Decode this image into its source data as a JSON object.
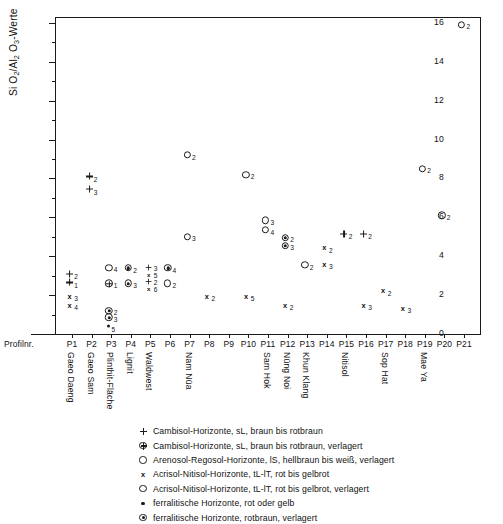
{
  "chart_data": {
    "type": "scatter",
    "title": "",
    "ylabel": "Si O2/Al2 O3-Werte",
    "xlabel": "Profilnr.",
    "ylim": [
      0,
      16.3
    ],
    "yticks": [
      0,
      2,
      4,
      6,
      8,
      10,
      12,
      14,
      16
    ],
    "grid": false,
    "legend_position": "below",
    "x_axis_prefix": "Profilnr.",
    "categories": [
      "P1",
      "P2",
      "P3",
      "P4",
      "P5",
      "P6",
      "P7",
      "P8",
      "P9",
      "P10",
      "P11",
      "P12",
      "P13",
      "P14",
      "P15",
      "P16",
      "P17",
      "P18",
      "P19",
      "P20",
      "P21"
    ],
    "site_names": [
      {
        "profile": "P1",
        "name": "Gaeo Daeng"
      },
      {
        "profile": "P2",
        "name": "Gaeo Sam"
      },
      {
        "profile": "P3",
        "name": "Plinthit-Fläche"
      },
      {
        "profile": "P4",
        "name": "Lignit"
      },
      {
        "profile": "P5",
        "name": "Waldwest"
      },
      {
        "profile": "P7",
        "name": "Nam Nüa"
      },
      {
        "profile": "P11",
        "name": "Sam Hok"
      },
      {
        "profile": "P12",
        "name": "Nüng Noi"
      },
      {
        "profile": "P13",
        "name": "Khun Klang"
      },
      {
        "profile": "P15",
        "name": "Nitisol"
      },
      {
        "profile": "P17",
        "name": "Sop Hat"
      },
      {
        "profile": "P19",
        "name": "Mae Ya"
      }
    ],
    "symbols": {
      "plus": "+",
      "plus_circle": "⊕",
      "circle": "○",
      "x": "x",
      "circle2": "○",
      "dot": "·",
      "ferralitic": "◉"
    },
    "points": [
      {
        "x": "P1",
        "y": 3.1,
        "symbol": "plus",
        "count": 2
      },
      {
        "x": "P1",
        "y": 2.65,
        "symbol": "plus",
        "count": 1
      },
      {
        "x": "P1",
        "y": 1.95,
        "symbol": "x",
        "count": 3
      },
      {
        "x": "P1",
        "y": 1.5,
        "symbol": "x",
        "count": 4
      },
      {
        "x": "P2",
        "y": 8.1,
        "symbol": "plus",
        "count": 2
      },
      {
        "x": "P2",
        "y": 7.45,
        "symbol": "plus",
        "count": 3
      },
      {
        "x": "P3",
        "y": 3.4,
        "symbol": "circle",
        "count": 4
      },
      {
        "x": "P3",
        "y": 2.6,
        "symbol": "plus_circle",
        "count": 1
      },
      {
        "x": "P3",
        "y": 1.2,
        "symbol": "ferralitic",
        "count": 2
      },
      {
        "x": "P3",
        "y": 0.85,
        "symbol": "ferralitic",
        "count": 3
      },
      {
        "x": "P3",
        "y": 0.4,
        "symbol": "dot",
        "count": 5
      },
      {
        "x": "P4",
        "y": 3.4,
        "symbol": "ferralitic",
        "count": 2
      },
      {
        "x": "P4",
        "y": 2.6,
        "symbol": "ferralitic",
        "count": 3
      },
      {
        "x": "P5",
        "y": 3.3,
        "symbol": "plus",
        "count": 3
      },
      {
        "x": "P5",
        "y": 3.0,
        "symbol": "x",
        "count": 5
      },
      {
        "x": "P5",
        "y": 2.75,
        "symbol": "plus",
        "count": 2
      },
      {
        "x": "P5",
        "y": 2.5,
        "symbol": "x",
        "count": 6
      },
      {
        "x": "P6",
        "y": 3.4,
        "symbol": "ferralitic",
        "count": 4
      },
      {
        "x": "P6",
        "y": 2.6,
        "symbol": "circle2",
        "count": 2
      },
      {
        "x": "P7",
        "y": 9.2,
        "symbol": "circle",
        "count": 2
      },
      {
        "x": "P7",
        "y": 5.0,
        "symbol": "circle",
        "count": 3
      },
      {
        "x": "P8",
        "y": 1.95,
        "symbol": "x",
        "count": 2
      },
      {
        "x": "P10",
        "y": 8.2,
        "symbol": "circle",
        "count": 2
      },
      {
        "x": "P10",
        "y": 1.95,
        "symbol": "x",
        "count": 5
      },
      {
        "x": "P11",
        "y": 5.85,
        "symbol": "circle",
        "count": 3
      },
      {
        "x": "P11",
        "y": 5.35,
        "symbol": "circle",
        "count": 4
      },
      {
        "x": "P12",
        "y": 4.95,
        "symbol": "ferralitic",
        "count": 2
      },
      {
        "x": "P12",
        "y": 4.55,
        "symbol": "ferralitic",
        "count": 3
      },
      {
        "x": "P12",
        "y": 1.5,
        "symbol": "x",
        "count": 2
      },
      {
        "x": "P13",
        "y": 3.55,
        "symbol": "circle",
        "count": 2
      },
      {
        "x": "P14",
        "y": 4.45,
        "symbol": "x",
        "count": 2
      },
      {
        "x": "P14",
        "y": 3.6,
        "symbol": "x",
        "count": 3
      },
      {
        "x": "P15",
        "y": 5.15,
        "symbol": "plus",
        "count": 2
      },
      {
        "x": "P16",
        "y": 1.5,
        "symbol": "x",
        "count": 3
      },
      {
        "x": "P16",
        "y": 5.15,
        "symbol": "plus",
        "count": 2
      },
      {
        "x": "P17",
        "y": 2.25,
        "symbol": "x",
        "count": 2
      },
      {
        "x": "P18",
        "y": 1.35,
        "symbol": "x",
        "count": 3
      },
      {
        "x": "P19",
        "y": 8.5,
        "symbol": "circle",
        "count": 2
      },
      {
        "x": "P20",
        "y": 6.1,
        "symbol": "circle",
        "count": 2
      },
      {
        "x": "P21",
        "y": 15.9,
        "symbol": "circle",
        "count": 2
      }
    ]
  },
  "legend": {
    "entries": [
      {
        "symbol": "plus",
        "label": "Cambisol-Horizonte, sL, braun bis rotbraun"
      },
      {
        "symbol": "plus_circle",
        "label": "Cambisol-Horizonte, sL, braun bis rotbraun, verlagert"
      },
      {
        "symbol": "circle",
        "label": "Arenosol-Regosol-Horizonte, lS, hellbraun bis weiß, verlagert"
      },
      {
        "symbol": "x",
        "label": "Acrisol-Nitisol-Horizonte, tL-lT, rot bis gelbrot"
      },
      {
        "symbol": "circle2",
        "label": "Acrisol-Nitisol-Horizonte, tL-lT, rot bis gelbrot, verlagert"
      },
      {
        "symbol": "dot",
        "label": "ferralitische Horizonte, rot oder gelb"
      },
      {
        "symbol": "ferralitic",
        "label": "ferralitische Horizonte, rotbraun, verlagert"
      }
    ]
  }
}
